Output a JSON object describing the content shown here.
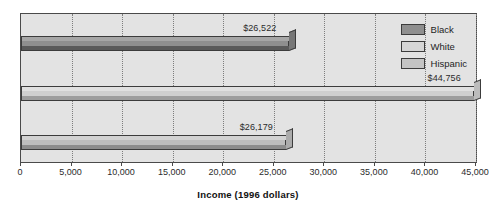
{
  "chart_data": {
    "type": "bar",
    "orientation": "horizontal",
    "title": "",
    "xlabel": "Income (1996 dollars)",
    "ylabel": "",
    "xlim": [
      0,
      45000
    ],
    "xticks": [
      0,
      5000,
      10000,
      15000,
      20000,
      25000,
      30000,
      35000,
      40000,
      45000
    ],
    "xtick_labels": [
      "0",
      "5,000",
      "10,000",
      "15,000",
      "20,000",
      "25,000",
      "30,000",
      "35,000",
      "40,000",
      "45,000"
    ],
    "grid": "vertical-dotted",
    "legend_position": "top-right",
    "categories": [
      "Black",
      "White",
      "Hispanic"
    ],
    "values": [
      26522,
      44756,
      26179
    ],
    "data_labels": [
      "$26,522",
      "$44,756",
      "$26,179"
    ],
    "series": [
      {
        "name": "Black",
        "value": 26522,
        "label": "$26,522",
        "color": "#8f8f8f"
      },
      {
        "name": "White",
        "value": 44756,
        "label": "$44,756",
        "color": "#cfcfcf"
      },
      {
        "name": "Hispanic",
        "value": 26179,
        "label": "$26,179",
        "color": "#bdbdbd"
      }
    ]
  },
  "legend": {
    "items": [
      {
        "label": "Black"
      },
      {
        "label": "White"
      },
      {
        "label": "Hispanic"
      }
    ]
  },
  "axis": {
    "title": "Income (1996 dollars)"
  },
  "colors": {
    "plot_background": "#e3e3e3",
    "plot_border": "#4a4a4a",
    "gridline": "#7d7d7d",
    "bar_black": "#8f8f8f",
    "bar_white": "#cfcfcf",
    "bar_hispanic": "#bdbdbd",
    "text": "#2b2b2b"
  }
}
